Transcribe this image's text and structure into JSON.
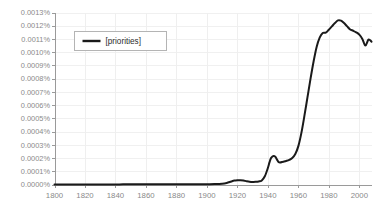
{
  "chart_data": {
    "type": "line",
    "title": "",
    "subtitle": "",
    "xlabel": "",
    "ylabel": "",
    "grid": true,
    "legend_position": "top-left",
    "xlim": [
      1800,
      2008
    ],
    "ylim": [
      0.0,
      0.0013
    ],
    "x_tick_labels": [
      "1800",
      "1820",
      "1840",
      "1860",
      "1880",
      "1900",
      "1920",
      "1940",
      "1960",
      "1980",
      "2000"
    ],
    "x_ticks": [
      1800,
      1820,
      1840,
      1860,
      1880,
      1900,
      1920,
      1940,
      1960,
      1980,
      2000
    ],
    "y_tick_labels": [
      "0.0013%",
      "0.0012%",
      "0.0011%",
      "0.0010%",
      "0.0009%",
      "0.0008%",
      "0.0007%",
      "0.0006%",
      "0.0005%",
      "0.0004%",
      "0.0003%",
      "0.0002%",
      "0.0001%",
      "0.0000%"
    ],
    "y_ticks": [
      0.0013,
      0.0012,
      0.0011,
      0.001,
      0.0009,
      0.0008,
      0.0007,
      0.0006,
      0.0005,
      0.0004,
      0.0003,
      0.0002,
      0.0001,
      0.0
    ],
    "y_unit": "%",
    "series": [
      {
        "name": "[priorities]",
        "color": "#1a1a1a",
        "x": [
          1800,
          1805,
          1810,
          1815,
          1820,
          1825,
          1830,
          1835,
          1840,
          1845,
          1850,
          1855,
          1860,
          1865,
          1870,
          1875,
          1880,
          1885,
          1890,
          1895,
          1900,
          1905,
          1910,
          1913,
          1916,
          1918,
          1920,
          1922,
          1924,
          1926,
          1928,
          1930,
          1932,
          1934,
          1936,
          1938,
          1940,
          1941,
          1942,
          1943,
          1944,
          1945,
          1946,
          1947,
          1948,
          1950,
          1952,
          1954,
          1956,
          1958,
          1960,
          1962,
          1964,
          1966,
          1968,
          1970,
          1972,
          1974,
          1976,
          1978,
          1980,
          1982,
          1984,
          1986,
          1988,
          1990,
          1992,
          1994,
          1996,
          1998,
          2000,
          2002,
          2004,
          2006,
          2008
        ],
        "y": [
          5e-07,
          5e-07,
          6e-07,
          6e-07,
          7e-07,
          7e-07,
          8e-07,
          8e-07,
          9e-07,
          1e-06,
          1e-06,
          1.1e-06,
          1.2e-06,
          1.3e-06,
          1.4e-06,
          1.5e-06,
          1.6e-06,
          1.8e-06,
          2e-06,
          2.2e-06,
          2.6e-06,
          3.2e-06,
          6e-06,
          1.2e-05,
          2.3e-05,
          2.95e-05,
          3.2e-05,
          3.25e-05,
          3e-05,
          2.5e-05,
          2.1e-05,
          1.95e-05,
          2e-05,
          2.3e-05,
          3.1e-05,
          6.2e-05,
          0.000125,
          0.000165,
          0.000198,
          0.000212,
          0.000215,
          0.000209,
          0.000188,
          0.00017,
          0.000166,
          0.000172,
          0.000178,
          0.000186,
          0.0002,
          0.00023,
          0.00029,
          0.00039,
          0.00052,
          0.00066,
          0.0008,
          0.00093,
          0.00104,
          0.00111,
          0.001145,
          0.001148,
          0.00117,
          0.001195,
          0.00122,
          0.00124,
          0.001238,
          0.00122,
          0.001195,
          0.001172,
          0.001162,
          0.00115,
          0.001133,
          0.0011,
          0.00105,
          0.001095,
          0.00108
        ]
      }
    ]
  },
  "legend": {
    "entries": [
      {
        "label": "[priorities]",
        "color": "#1a1a1a",
        "icon": "line-swatch-icon"
      }
    ]
  },
  "colors": {
    "background": "#ffffff",
    "series_line": "#1a1a1a",
    "gridline": "#f0f0f0",
    "axis": "#9a9a9a",
    "tick_text": "#8a8a8a",
    "legend_border": "#b4b4b4",
    "legend_text": "#2b2b2b"
  }
}
